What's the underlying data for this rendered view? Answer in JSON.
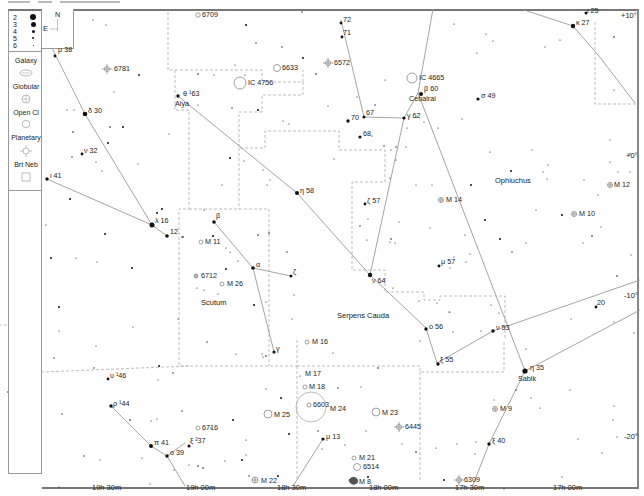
{
  "legend": {
    "magnitudes": [
      "2",
      "3",
      "4",
      "5",
      "6"
    ],
    "compass": {
      "north": "N",
      "east": "E"
    },
    "types": [
      {
        "label": "Galaxy",
        "icon": "galaxy-icon"
      },
      {
        "label": "Globular",
        "icon": "globular-cluster-icon"
      },
      {
        "label": "Open Cl",
        "icon": "open-cluster-icon"
      },
      {
        "label": "Planetary",
        "icon": "planetary-nebula-icon"
      },
      {
        "label": "Brt Neb",
        "icon": "bright-nebula-icon"
      }
    ]
  },
  "constellations": [
    {
      "name": "Ophiuchus",
      "x": 495,
      "y": 180
    },
    {
      "name": "Scutum",
      "x": 201,
      "y": 302
    },
    {
      "name": "Serpens Cauda",
      "x": 337,
      "y": 314
    }
  ],
  "star_labels": [
    {
      "text": "μ 38",
      "x": 55,
      "y": 50
    },
    {
      "text": "δ 30",
      "x": 87,
      "y": 111
    },
    {
      "text": "ν 32",
      "x": 84,
      "y": 150
    },
    {
      "text": "ι 41",
      "x": 50,
      "y": 175
    },
    {
      "text": "λ 16",
      "x": 154,
      "y": 220
    },
    {
      "text": "12",
      "x": 170,
      "y": 230
    },
    {
      "text": "θ ¹63",
      "x": 183,
      "y": 92
    },
    {
      "text": "Alya",
      "x": 177,
      "y": 103
    },
    {
      "text": "η 58",
      "x": 299,
      "y": 190
    },
    {
      "text": "ζ 57",
      "x": 366,
      "y": 201
    },
    {
      "text": "β",
      "x": 215,
      "y": 217
    },
    {
      "text": "α",
      "x": 256,
      "y": 265
    },
    {
      "text": "ζ",
      "x": 293,
      "y": 270
    },
    {
      "text": "γ",
      "x": 275,
      "y": 347
    },
    {
      "text": "ν 64",
      "x": 372,
      "y": 281
    },
    {
      "text": "72",
      "x": 343,
      "y": 19
    },
    {
      "text": "71",
      "x": 343,
      "y": 31
    },
    {
      "text": "β 60",
      "x": 424,
      "y": 87
    },
    {
      "text": "Cebalrai",
      "x": 410,
      "y": 96
    },
    {
      "text": "σ 49",
      "x": 481,
      "y": 93
    },
    {
      "text": "70",
      "x": 351,
      "y": 115
    },
    {
      "text": "67",
      "x": 365,
      "y": 110
    },
    {
      "text": "γ 62",
      "x": 408,
      "y": 113
    },
    {
      "text": "68",
      "x": 363,
      "y": 131
    },
    {
      "text": "ι 25",
      "x": 585,
      "y": 9
    },
    {
      "text": "κ 27",
      "x": 575,
      "y": 20
    },
    {
      "text": "μ 57",
      "x": 441,
      "y": 259
    },
    {
      "text": "ο 56",
      "x": 430,
      "y": 324
    },
    {
      "text": "ν 53",
      "x": 498,
      "y": 325
    },
    {
      "text": "20",
      "x": 598,
      "y": 300
    },
    {
      "text": "ξ 55",
      "x": 441,
      "y": 357
    },
    {
      "text": "η 35",
      "x": 529,
      "y": 365
    },
    {
      "text": "Sabik",
      "x": 518,
      "y": 375
    },
    {
      "text": "ξ 40",
      "x": 492,
      "y": 438
    },
    {
      "text": "μ 13",
      "x": 327,
      "y": 434
    },
    {
      "text": "υ ¹46",
      "x": 110,
      "y": 373
    },
    {
      "text": "ρ ¹44",
      "x": 113,
      "y": 401
    },
    {
      "text": "π 41",
      "x": 151,
      "y": 440
    },
    {
      "text": "ο 39",
      "x": 171,
      "y": 450
    },
    {
      "text": "ξ ²37",
      "x": 191,
      "y": 438
    }
  ],
  "dso_labels": [
    {
      "text": "6709",
      "x": 201,
      "y": 13,
      "type": "open"
    },
    {
      "text": "6781",
      "x": 114,
      "y": 66,
      "type": "planetary"
    },
    {
      "text": "6633",
      "x": 282,
      "y": 66,
      "type": "open"
    },
    {
      "text": "6572",
      "x": 333,
      "y": 63,
      "type": "planetary"
    },
    {
      "text": "IC 4756",
      "x": 247,
      "y": 79,
      "type": "open-large"
    },
    {
      "text": "IC 4665",
      "x": 420,
      "y": 75,
      "type": "open-large"
    },
    {
      "text": "M 14",
      "x": 446,
      "y": 200,
      "type": "globular"
    },
    {
      "text": "M 12",
      "x": 614,
      "y": 185,
      "type": "globular"
    },
    {
      "text": "M 10",
      "x": 576,
      "y": 213,
      "type": "globular"
    },
    {
      "text": "M 11",
      "x": 207,
      "y": 241,
      "type": "open"
    },
    {
      "text": "6712",
      "x": 201,
      "y": 275,
      "type": "globular"
    },
    {
      "text": "M 26",
      "x": 227,
      "y": 284,
      "type": "open"
    },
    {
      "text": "M 16",
      "x": 314,
      "y": 341,
      "type": "open"
    },
    {
      "text": "M 17",
      "x": 305,
      "y": 373,
      "type": "nebula"
    },
    {
      "text": "M 18",
      "x": 309,
      "y": 387,
      "type": "open"
    },
    {
      "text": "6603",
      "x": 312,
      "y": 404,
      "type": "open"
    },
    {
      "text": "M 24",
      "x": 330,
      "y": 407,
      "type": "star-cloud"
    },
    {
      "text": "M 25",
      "x": 273,
      "y": 414,
      "type": "open-large"
    },
    {
      "text": "M 23",
      "x": 382,
      "y": 412,
      "type": "open-large"
    },
    {
      "text": "6445",
      "x": 404,
      "y": 426,
      "type": "planetary"
    },
    {
      "text": "M 9",
      "x": 500,
      "y": 409,
      "type": "globular"
    },
    {
      "text": "6716",
      "x": 203,
      "y": 428,
      "type": "open"
    },
    {
      "text": "M 21",
      "x": 363,
      "y": 457,
      "type": "open"
    },
    {
      "text": "6514",
      "x": 364,
      "y": 466,
      "type": "nebula"
    },
    {
      "text": "M 22",
      "x": 261,
      "y": 480,
      "type": "globular"
    },
    {
      "text": "M 8",
      "x": 359,
      "y": 482,
      "type": "nebula"
    },
    {
      "text": "6309",
      "x": 464,
      "y": 479,
      "type": "planetary"
    }
  ],
  "axes": {
    "ra_labels": [
      {
        "text": "19h 30m",
        "x": 92,
        "y": 486
      },
      {
        "text": "19h 00m",
        "x": 186,
        "y": 486
      },
      {
        "text": "18h 30m",
        "x": 277,
        "y": 486
      },
      {
        "text": "18h 00m",
        "x": 369,
        "y": 486
      },
      {
        "text": "17h 30m",
        "x": 455,
        "y": 486
      },
      {
        "text": "17h 00m",
        "x": 553,
        "y": 486
      }
    ],
    "dec_labels": [
      {
        "text": "+10°",
        "x": 622,
        "y": 12
      },
      {
        "text": "+0°",
        "x": 626,
        "y": 155
      },
      {
        "text": "-10°",
        "x": 624,
        "y": 294
      },
      {
        "text": "-20°",
        "x": 625,
        "y": 435
      }
    ]
  },
  "colors": {
    "line": "#999999",
    "boundary": "#b0b0b0",
    "star": "#111111",
    "frame": "#777777"
  }
}
